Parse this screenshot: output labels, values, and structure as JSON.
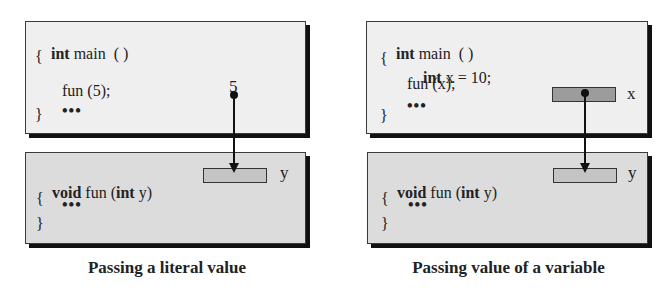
{
  "left_panel": {
    "caller": {
      "lines": [
        {
          "kw": "int",
          "text": " main  ( )"
        },
        {
          "kw": "",
          "text": "{"
        },
        {
          "kw": "",
          "text": "fun (5);"
        },
        {
          "kw": "",
          "text": "}"
        }
      ],
      "ellipsis": "•••",
      "value_label": "5"
    },
    "callee": {
      "sig_kw": "void",
      "sig_mid": " fun (",
      "sig_kw2": "int",
      "sig_end": " y)",
      "open_brace": "{",
      "ellipsis": "•••",
      "close_brace": "}",
      "param_label": "y"
    },
    "caption": "Passing a literal value"
  },
  "right_panel": {
    "caller": {
      "line1_kw": "int",
      "line1_text": " main  ( )",
      "open_brace": "{",
      "decl_kw": "int",
      "decl_text": " x = 10;",
      "call": "fun (x);",
      "close_brace": "}",
      "ellipsis": "•••",
      "var_label": "x"
    },
    "callee": {
      "sig_kw": "void",
      "sig_mid": " fun (",
      "sig_kw2": "int",
      "sig_end": " y)",
      "open_brace": "{",
      "ellipsis": "•••",
      "close_brace": "}",
      "param_label": "y"
    },
    "caption": "Passing value of a variable"
  },
  "colors": {
    "top_box_fill": "#efefef",
    "bottom_box_fill": "#dcdcdc",
    "param_cell_fill": "#c4c4c4",
    "var_cell_fill": "#9c9c9c",
    "shadow": "#111111"
  }
}
